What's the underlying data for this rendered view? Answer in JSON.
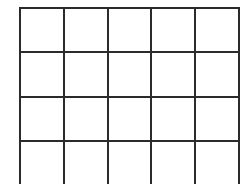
{
  "canvas": {
    "width": 246,
    "height": 184,
    "background_color": "#ffffff"
  },
  "grid": {
    "title": "empty-grid",
    "columns": 5,
    "rows": 4,
    "left": 19,
    "top": 7,
    "width": 209,
    "height": 169,
    "cell_width": 41.8,
    "cell_height": 42.25,
    "line_color": "#2b2b2b",
    "line_width_px": 2,
    "cell_fill_color": "#ffffff",
    "cells": [
      [
        "",
        "",
        "",
        "",
        ""
      ],
      [
        "",
        "",
        "",
        "",
        ""
      ],
      [
        "",
        "",
        "",
        "",
        ""
      ],
      [
        "",
        "",
        "",
        "",
        ""
      ]
    ]
  }
}
